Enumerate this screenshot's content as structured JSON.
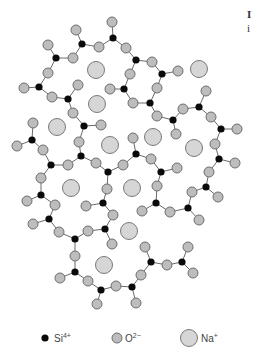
{
  "figure": {
    "side_text": [
      "I",
      "i"
    ]
  },
  "legend": [
    {
      "kind": "si",
      "label": "Si",
      "sup": "4+"
    },
    {
      "kind": "o",
      "label": "O",
      "sup": "2−"
    },
    {
      "kind": "na",
      "label": "Na",
      "sup": "+"
    }
  ],
  "colors": {
    "si": "#0a0a0a",
    "o_fill": "#bdbdbd",
    "o_stroke": "#6e6e6e",
    "na_fill": "#d6d6d6",
    "na_stroke": "#7a7a7a",
    "bond": "#6a6a6a"
  },
  "atoms": {
    "si": [
      [
        113,
        38
      ],
      [
        82,
        44
      ],
      [
        56,
        58
      ],
      [
        39,
        87
      ],
      [
        68,
        99
      ],
      [
        136,
        60
      ],
      [
        162,
        74
      ],
      [
        124,
        89
      ],
      [
        150,
        103
      ],
      [
        84,
        126
      ],
      [
        173,
        120
      ],
      [
        199,
        107
      ],
      [
        221,
        129
      ],
      [
        32,
        140
      ],
      [
        81,
        156
      ],
      [
        51,
        165
      ],
      [
        108,
        172
      ],
      [
        136,
        154
      ],
      [
        161,
        172
      ],
      [
        219,
        159
      ],
      [
        41,
        195
      ],
      [
        103,
        203
      ],
      [
        156,
        203
      ],
      [
        206,
        187
      ],
      [
        188,
        208
      ],
      [
        49,
        219
      ],
      [
        105,
        229
      ],
      [
        75,
        239
      ],
      [
        151,
        262
      ],
      [
        182,
        262
      ],
      [
        75,
        272
      ],
      [
        101,
        290
      ],
      [
        132,
        287
      ]
    ],
    "o": [
      [
        112,
        22
      ],
      [
        76,
        30
      ],
      [
        48,
        45
      ],
      [
        99,
        47
      ],
      [
        126,
        48
      ],
      [
        73,
        58
      ],
      [
        152,
        62
      ],
      [
        48,
        73
      ],
      [
        130,
        74
      ],
      [
        178,
        71
      ],
      [
        24,
        88
      ],
      [
        78,
        85
      ],
      [
        110,
        89
      ],
      [
        52,
        97
      ],
      [
        157,
        88
      ],
      [
        206,
        91
      ],
      [
        73,
        113
      ],
      [
        133,
        103
      ],
      [
        183,
        109
      ],
      [
        101,
        125
      ],
      [
        157,
        116
      ],
      [
        211,
        117
      ],
      [
        237,
        129
      ],
      [
        33,
        123
      ],
      [
        79,
        142
      ],
      [
        133,
        138
      ],
      [
        176,
        134
      ],
      [
        215,
        144
      ],
      [
        17,
        146
      ],
      [
        43,
        150
      ],
      [
        68,
        165
      ],
      [
        96,
        163
      ],
      [
        123,
        165
      ],
      [
        151,
        159
      ],
      [
        235,
        163
      ],
      [
        177,
        168
      ],
      [
        209,
        172
      ],
      [
        41,
        178
      ],
      [
        107,
        189
      ],
      [
        157,
        186
      ],
      [
        192,
        192
      ],
      [
        218,
        197
      ],
      [
        27,
        201
      ],
      [
        55,
        205
      ],
      [
        86,
        206
      ],
      [
        113,
        215
      ],
      [
        142,
        211
      ],
      [
        170,
        212
      ],
      [
        199,
        220
      ],
      [
        33,
        224
      ],
      [
        59,
        232
      ],
      [
        88,
        231
      ],
      [
        112,
        244
      ],
      [
        145,
        247
      ],
      [
        188,
        247
      ],
      [
        75,
        256
      ],
      [
        167,
        265
      ],
      [
        193,
        273
      ],
      [
        60,
        278
      ],
      [
        88,
        281
      ],
      [
        141,
        275
      ],
      [
        116,
        286
      ],
      [
        97,
        304
      ],
      [
        136,
        303
      ]
    ],
    "na": [
      [
        96,
        70
      ],
      [
        199,
        69
      ],
      [
        97,
        104
      ],
      [
        57,
        127
      ],
      [
        153,
        137
      ],
      [
        110,
        145
      ],
      [
        194,
        148
      ],
      [
        71,
        188
      ],
      [
        132,
        188
      ],
      [
        129,
        231
      ],
      [
        104,
        265
      ]
    ]
  }
}
